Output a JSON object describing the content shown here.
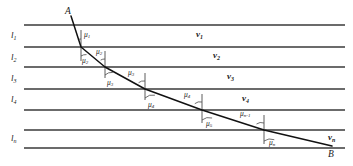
{
  "figure": {
    "type": "diagram",
    "colors": {
      "line": "#6b6b6b",
      "ray": "#111111",
      "normal": "#4a4a4a",
      "arc": "#4a4a4a",
      "text": "#1a1a1a",
      "background": "#ffffff"
    }
  },
  "points": {
    "start": "A",
    "end": "B"
  },
  "interfaces": [
    {
      "id": "line-0",
      "y": 25,
      "label": ""
    },
    {
      "id": "line-1",
      "y": 47,
      "label": "l1"
    },
    {
      "id": "line-2",
      "y": 67,
      "label": "l2"
    },
    {
      "id": "line-3",
      "y": 89,
      "label": "l3"
    },
    {
      "id": "line-4",
      "y": 110,
      "label": "l4"
    },
    {
      "id": "line-5",
      "y": 130,
      "label": ""
    },
    {
      "id": "line-6",
      "y": 148,
      "label": "ln"
    }
  ],
  "layer_labels": [
    {
      "base": "l",
      "sub": "1",
      "x": 14,
      "y": 37
    },
    {
      "base": "l",
      "sub": "2",
      "x": 14,
      "y": 59
    },
    {
      "base": "l",
      "sub": "3",
      "x": 14,
      "y": 80
    },
    {
      "base": "l",
      "sub": "4",
      "x": 14,
      "y": 101
    },
    {
      "base": "l",
      "sub": "n",
      "x": 14,
      "y": 140
    }
  ],
  "velocity_labels": [
    {
      "base": "v",
      "sub": "1",
      "x": 198,
      "y": 36
    },
    {
      "base": "v",
      "sub": "2",
      "x": 215,
      "y": 57
    },
    {
      "base": "v",
      "sub": "3",
      "x": 228,
      "y": 78
    },
    {
      "base": "v",
      "sub": "4",
      "x": 243,
      "y": 100
    },
    {
      "base": "v",
      "sub": "n",
      "x": 330,
      "y": 137
    }
  ],
  "angle_labels": [
    {
      "base": "μ",
      "sub": "1",
      "x": 85,
      "y": 36
    },
    {
      "base": "μ",
      "sub": "2",
      "x": 99,
      "y": 52
    },
    {
      "base": "μ",
      "sub": "2",
      "x": 85,
      "y": 62
    },
    {
      "base": "μ",
      "sub": "3",
      "x": 133,
      "y": 73
    },
    {
      "base": "μ",
      "sub": "3",
      "x": 113,
      "y": 84
    },
    {
      "base": "μ",
      "sub": "4",
      "x": 190,
      "y": 95
    },
    {
      "base": "μ",
      "sub": "4",
      "x": 155,
      "y": 106
    },
    {
      "base": "μ",
      "sub": "5",
      "x": 212,
      "y": 125
    },
    {
      "base": "μ",
      "sub": "n-1",
      "x": 244,
      "y": 115
    },
    {
      "base": "μ",
      "sub": "n",
      "x": 272,
      "y": 144
    }
  ],
  "ray_path": {
    "description": "Refracted ray from A down-right to B",
    "vertices": [
      {
        "x": 71,
        "y": 16
      },
      {
        "x": 81,
        "y": 47
      },
      {
        "x": 105,
        "y": 67
      },
      {
        "x": 145,
        "y": 89
      },
      {
        "x": 202,
        "y": 110
      },
      {
        "x": 264,
        "y": 130
      },
      {
        "x": 330,
        "y": 146
      }
    ]
  },
  "normals": [
    {
      "x": 81,
      "y1": 31,
      "y2": 47
    },
    {
      "x": 105,
      "y1": 51,
      "y2": 67
    },
    {
      "x": 105,
      "y1": 67,
      "y2": 77
    },
    {
      "x": 145,
      "y1": 74,
      "y2": 89
    },
    {
      "x": 145,
      "y1": 89,
      "y2": 99
    },
    {
      "x": 202,
      "y1": 95,
      "y2": 110
    },
    {
      "x": 202,
      "y1": 110,
      "y2": 122
    },
    {
      "x": 264,
      "y1": 116,
      "y2": 130
    },
    {
      "x": 264,
      "y1": 130,
      "y2": 143
    },
    {
      "x": 81,
      "y1": 47,
      "y2": 60
    }
  ],
  "point_labels": [
    {
      "text": "A",
      "x": 68,
      "y": 13
    },
    {
      "text": "B",
      "x": 330,
      "y": 158
    }
  ]
}
